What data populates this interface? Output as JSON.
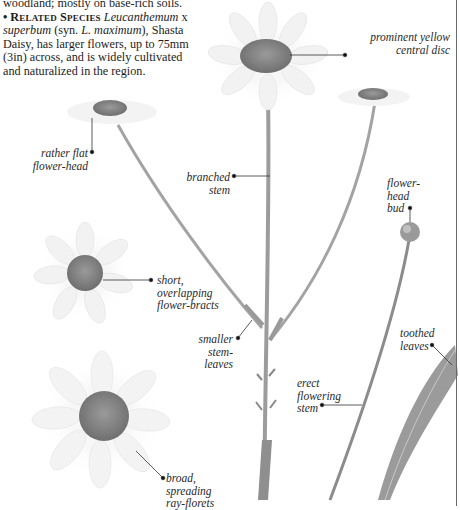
{
  "text": {
    "line1": "woodland; mostly on base-rich soils.",
    "bullet": "•",
    "related_heading": "Related Species",
    "related_species_italic": "Leucanthemum",
    "related_x": " x ",
    "related_species_epithet": "superbum",
    "syn_open": " (syn. ",
    "syn_name": "L. maximum",
    "syn_close": "), Shasta Daisy, has larger flowers, up to 75mm (3in) across, and is widely cultivated and naturalized in the region."
  },
  "labels": {
    "central_disc": "prominent yellow\ncentral disc",
    "flat_head": "rather flat\nflower-head",
    "branched_stem": "branched\nstem",
    "bud": "flower-\nhead\nbud",
    "bracts": "short,\noverlapping\nflower-bracts",
    "stem_leaves": "smaller\nstem-leaves",
    "toothed_leaves": "toothed\nleaves",
    "erect_stem": "erect\nflowering\nstem",
    "ray_florets": "broad,\nspreading\nray-florets"
  },
  "colors": {
    "rule": "#6a6a6a",
    "disc": "#8a8a8a",
    "petal": "#f4f4f4",
    "stem": "#9a9a9a",
    "leader": "#333333"
  }
}
